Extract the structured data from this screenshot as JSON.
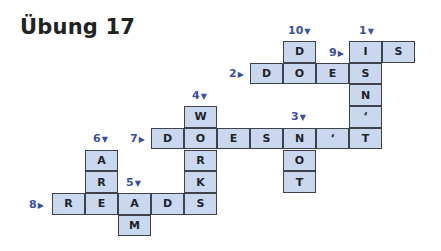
{
  "title": "Übung 17",
  "colors": {
    "cell_fill": "#c9d8ee",
    "cell_border": "#3d424c",
    "clue_label": "#3c4fa2",
    "text": "#222222"
  },
  "grid": {
    "origin_x": 52,
    "origin_y": 41,
    "cell_w": 33,
    "cell_h": 21.7
  },
  "cells": [
    {
      "row": 0,
      "col": 7,
      "letter": "D"
    },
    {
      "row": 0,
      "col": 9,
      "letter": "I"
    },
    {
      "row": 0,
      "col": 10,
      "letter": "S"
    },
    {
      "row": 1,
      "col": 6,
      "letter": "D"
    },
    {
      "row": 1,
      "col": 7,
      "letter": "O"
    },
    {
      "row": 1,
      "col": 8,
      "letter": "E"
    },
    {
      "row": 1,
      "col": 9,
      "letter": "S"
    },
    {
      "row": 2,
      "col": 9,
      "letter": "N"
    },
    {
      "row": 3,
      "col": 4,
      "letter": "W"
    },
    {
      "row": 3,
      "col": 9,
      "letter": "‘"
    },
    {
      "row": 4,
      "col": 3,
      "letter": "D"
    },
    {
      "row": 4,
      "col": 4,
      "letter": "O"
    },
    {
      "row": 4,
      "col": 5,
      "letter": "E"
    },
    {
      "row": 4,
      "col": 6,
      "letter": "S"
    },
    {
      "row": 4,
      "col": 7,
      "letter": "N"
    },
    {
      "row": 4,
      "col": 8,
      "letter": "‘"
    },
    {
      "row": 4,
      "col": 9,
      "letter": "T"
    },
    {
      "row": 5,
      "col": 1,
      "letter": "A"
    },
    {
      "row": 5,
      "col": 4,
      "letter": "R"
    },
    {
      "row": 5,
      "col": 7,
      "letter": "O"
    },
    {
      "row": 6,
      "col": 1,
      "letter": "R"
    },
    {
      "row": 6,
      "col": 4,
      "letter": "K"
    },
    {
      "row": 6,
      "col": 7,
      "letter": "T"
    },
    {
      "row": 7,
      "col": 0,
      "letter": "R"
    },
    {
      "row": 7,
      "col": 1,
      "letter": "E"
    },
    {
      "row": 7,
      "col": 2,
      "letter": "A"
    },
    {
      "row": 7,
      "col": 3,
      "letter": "D"
    },
    {
      "row": 7,
      "col": 4,
      "letter": "S"
    },
    {
      "row": 8,
      "col": 2,
      "letter": "M"
    }
  ],
  "clues": [
    {
      "number": "10",
      "direction": "down",
      "arrow": "▼",
      "x": 288,
      "y": 24
    },
    {
      "number": "1",
      "direction": "down",
      "arrow": "▼",
      "x": 359,
      "y": 24
    },
    {
      "number": "9",
      "direction": "across",
      "arrow": "▶",
      "x": 329,
      "y": 46
    },
    {
      "number": "2",
      "direction": "across",
      "arrow": "▶",
      "x": 229,
      "y": 67
    },
    {
      "number": "4",
      "direction": "down",
      "arrow": "▼",
      "x": 192,
      "y": 89
    },
    {
      "number": "3",
      "direction": "down",
      "arrow": "▼",
      "x": 291,
      "y": 110
    },
    {
      "number": "6",
      "direction": "down",
      "arrow": "▼",
      "x": 93,
      "y": 132
    },
    {
      "number": "7",
      "direction": "across",
      "arrow": "▶",
      "x": 130,
      "y": 132
    },
    {
      "number": "5",
      "direction": "down",
      "arrow": "▼",
      "x": 126,
      "y": 176
    },
    {
      "number": "8",
      "direction": "across",
      "arrow": "▶",
      "x": 29,
      "y": 198
    }
  ],
  "answers": {
    "across": [
      {
        "number": "2",
        "word": "DOES"
      },
      {
        "number": "7",
        "word": "DOESN'T"
      },
      {
        "number": "8",
        "word": "READS"
      },
      {
        "number": "9",
        "word": "IS"
      }
    ],
    "down": [
      {
        "number": "1",
        "word": "ISN'T"
      },
      {
        "number": "3",
        "word": "NOT"
      },
      {
        "number": "4",
        "word": "WORKS"
      },
      {
        "number": "5",
        "word": "AM"
      },
      {
        "number": "6",
        "word": "ARE"
      },
      {
        "number": "10",
        "word": "DO"
      }
    ]
  }
}
